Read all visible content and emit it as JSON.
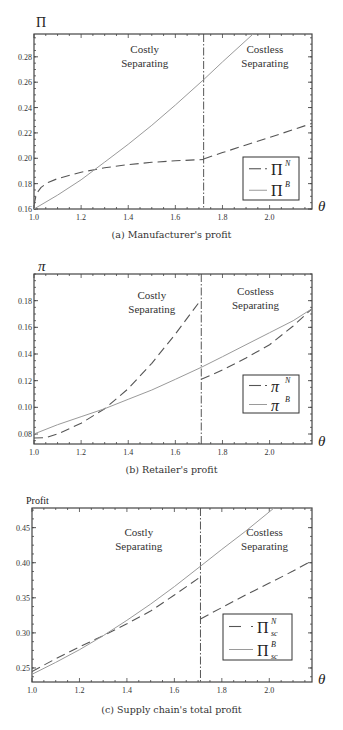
{
  "figure": {
    "captions": [
      "(a) Manufacturer's profit",
      "(b) Retailer's profit",
      "(c) Supply chain's total profit"
    ]
  },
  "chart_data": [
    {
      "type": "line",
      "title": "(a) Manufacturer's profit",
      "xlabel": "θ",
      "ylabel": "Π",
      "xlim": [
        1.0,
        2.18
      ],
      "ylim": [
        0.16,
        0.298
      ],
      "xticks": [
        1.0,
        1.2,
        1.4,
        1.6,
        1.8,
        2.0
      ],
      "xtick_labels": [
        "1.0",
        "1.2",
        "1.4",
        "1.6",
        "1.8",
        "2.0"
      ],
      "yticks": [
        0.16,
        0.18,
        0.2,
        0.22,
        0.24,
        0.26,
        0.28
      ],
      "ytick_labels": [
        "0.16",
        "0.18",
        "0.20",
        "0.22",
        "0.24",
        "0.26",
        "0.28"
      ],
      "threshold": 1.72,
      "regions": [
        {
          "line1": "Costly",
          "line2": "Separating",
          "x": 1.47,
          "y": 0.283
        },
        {
          "line1": "Costless",
          "line2": "Separating",
          "x": 1.98,
          "y": 0.283
        }
      ],
      "legend_position": "lower right",
      "legend": [
        {
          "symbol": "Π",
          "sup": "N",
          "sub": "",
          "style": "dashed"
        },
        {
          "symbol": "Π",
          "sup": "B",
          "sub": "",
          "style": "solid"
        }
      ],
      "series": [
        {
          "name": "Π^N",
          "style": "dashed",
          "segments": [
            {
              "x": [
                1.0,
                1.01,
                1.03,
                1.06,
                1.1,
                1.2,
                1.3,
                1.4,
                1.5,
                1.6,
                1.72
              ],
              "y": [
                0.163,
                0.172,
                0.177,
                0.181,
                0.184,
                0.189,
                0.1925,
                0.195,
                0.1968,
                0.198,
                0.199
              ]
            },
            {
              "x": [
                1.72,
                1.8,
                1.9,
                2.0,
                2.1,
                2.18
              ],
              "y": [
                0.1995,
                0.2045,
                0.2105,
                0.2165,
                0.2225,
                0.2275
              ]
            }
          ]
        },
        {
          "name": "Π^B",
          "style": "solid",
          "segments": [
            {
              "x": [
                1.0,
                1.1,
                1.2,
                1.3,
                1.4,
                1.5,
                1.6,
                1.72,
                1.8,
                1.93
              ],
              "y": [
                0.16,
                0.171,
                0.183,
                0.197,
                0.211,
                0.226,
                0.242,
                0.262,
                0.276,
                0.298
              ]
            }
          ]
        }
      ]
    },
    {
      "type": "line",
      "title": "(b) Retailer's profit",
      "xlabel": "θ",
      "ylabel": "π",
      "xlim": [
        1.0,
        2.18
      ],
      "ylim": [
        0.0725,
        0.2
      ],
      "xticks": [
        1.0,
        1.2,
        1.4,
        1.6,
        1.8,
        2.0
      ],
      "xtick_labels": [
        "1.0",
        "1.2",
        "1.4",
        "1.6",
        "1.8",
        "2.0"
      ],
      "yticks": [
        0.08,
        0.1,
        0.12,
        0.14,
        0.16,
        0.18
      ],
      "ytick_labels": [
        "0.08",
        "0.10",
        "0.12",
        "0.14",
        "0.16",
        "0.18"
      ],
      "threshold": 1.71,
      "regions": [
        {
          "line1": "Costly",
          "line2": "Separating",
          "x": 1.5,
          "y": 0.181
        },
        {
          "line1": "Costless",
          "line2": "Separating",
          "x": 1.94,
          "y": 0.184
        }
      ],
      "legend_position": "lower right",
      "legend": [
        {
          "symbol": "π",
          "sup": "N",
          "sub": "",
          "style": "dashed"
        },
        {
          "symbol": "π",
          "sup": "B",
          "sub": "",
          "style": "solid"
        }
      ],
      "series": [
        {
          "name": "π^N",
          "style": "dashed",
          "segments": [
            {
              "x": [
                1.0,
                1.05,
                1.1,
                1.2,
                1.3,
                1.4,
                1.5,
                1.6,
                1.71
              ],
              "y": [
                0.077,
                0.0772,
                0.08,
                0.088,
                0.099,
                0.114,
                0.133,
                0.155,
                0.181
              ]
            },
            {
              "x": [
                1.71,
                1.8,
                1.9,
                2.0,
                2.1,
                2.18
              ],
              "y": [
                0.121,
                0.128,
                0.137,
                0.147,
                0.161,
                0.174
              ]
            }
          ]
        },
        {
          "name": "π^B",
          "style": "solid",
          "segments": [
            {
              "x": [
                1.0,
                1.1,
                1.2,
                1.3,
                1.4,
                1.5,
                1.6,
                1.71,
                1.8,
                1.9,
                2.0,
                2.1,
                2.18
              ],
              "y": [
                0.08,
                0.087,
                0.093,
                0.099,
                0.106,
                0.113,
                0.121,
                0.13,
                0.138,
                0.147,
                0.156,
                0.165,
                0.174
              ]
            }
          ]
        }
      ]
    },
    {
      "type": "line",
      "title": "(c) Supply chain's total profit",
      "xlabel": "θ",
      "ylabel": "Profit",
      "xlim": [
        1.0,
        2.18
      ],
      "ylim": [
        0.23,
        0.478
      ],
      "xticks": [
        1.0,
        1.2,
        1.4,
        1.6,
        1.8,
        2.0
      ],
      "xtick_labels": [
        "1.0",
        "1.2",
        "1.4",
        "1.6",
        "1.8",
        "2.0"
      ],
      "yticks": [
        0.25,
        0.3,
        0.35,
        0.4,
        0.45
      ],
      "ytick_labels": [
        "0.25",
        "0.30",
        "0.35",
        "0.40",
        "0.45"
      ],
      "threshold": 1.71,
      "regions": [
        {
          "line1": "Costly",
          "line2": "Separating",
          "x": 1.45,
          "y": 0.438
        },
        {
          "line1": "Costless",
          "line2": "Separating",
          "x": 1.98,
          "y": 0.438
        }
      ],
      "legend_position": "lower right",
      "legend": [
        {
          "symbol": "Π",
          "sup": "N",
          "sub": "sc",
          "style": "dashed"
        },
        {
          "symbol": "Π",
          "sup": "B",
          "sub": "sc",
          "style": "solid"
        }
      ],
      "series": [
        {
          "name": "Π_sc^N",
          "style": "dashed",
          "segments": [
            {
              "x": [
                1.0,
                1.1,
                1.2,
                1.3,
                1.4,
                1.5,
                1.6,
                1.71
              ],
              "y": [
                0.245,
                0.263,
                0.28,
                0.296,
                0.313,
                0.331,
                0.354,
                0.38
              ]
            },
            {
              "x": [
                1.71,
                1.8,
                1.9,
                2.0,
                2.1,
                2.18
              ],
              "y": [
                0.32,
                0.336,
                0.354,
                0.371,
                0.388,
                0.403
              ]
            }
          ]
        },
        {
          "name": "Π_sc^B",
          "style": "solid",
          "segments": [
            {
              "x": [
                1.0,
                1.1,
                1.2,
                1.3,
                1.4,
                1.5,
                1.6,
                1.71,
                1.8,
                1.9,
                2.02
              ],
              "y": [
                0.241,
                0.258,
                0.276,
                0.296,
                0.318,
                0.341,
                0.366,
                0.395,
                0.419,
                0.445,
                0.478
              ]
            }
          ]
        }
      ]
    }
  ],
  "layout": {
    "frames": [
      {
        "left": 34,
        "top": 34,
        "right": 312,
        "bottom": 209,
        "caption_top": 229,
        "legend": {
          "x": 243,
          "y": 157,
          "w": 56,
          "h": 43
        },
        "ylabel_x": 36,
        "ylabel_y": 27
      },
      {
        "left": 34,
        "top": 274,
        "right": 312,
        "bottom": 444,
        "caption_top": 464,
        "legend": {
          "x": 243,
          "y": 375,
          "w": 56,
          "h": 38
        },
        "ylabel_x": 38,
        "ylabel_y": 271
      },
      {
        "left": 32,
        "top": 508,
        "right": 312,
        "bottom": 682,
        "caption_top": 704,
        "legend": {
          "x": 223,
          "y": 614,
          "w": 69,
          "h": 46
        },
        "ylabel_x": 26,
        "ylabel_y": 504
      }
    ]
  }
}
